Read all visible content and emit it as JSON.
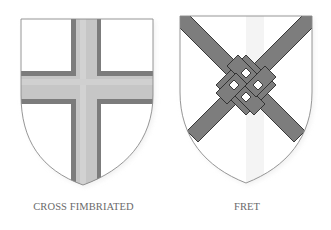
{
  "figures": [
    {
      "id": "cross-fimbriated",
      "caption": "CROSS FIMBRIATED",
      "charge": "cross fimbriated",
      "colors": {
        "field": "#ffffff",
        "outline": "#8a8a8a",
        "fimbriation": "#7c7c7c",
        "cross": "#c9c9c9"
      }
    },
    {
      "id": "fret",
      "caption": "FRET",
      "charge": "fret",
      "colors": {
        "field": "#ffffff",
        "outline": "#8a8a8a",
        "band_fill": "#7d7d7d",
        "band_edge": "#2a2a2a"
      }
    }
  ]
}
